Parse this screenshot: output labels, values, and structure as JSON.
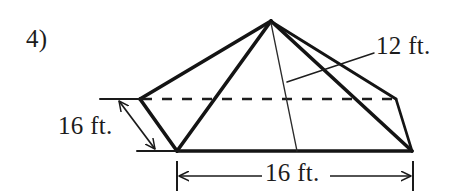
{
  "figure": {
    "problem_number": "4)",
    "shape": "square-pyramid",
    "labels": {
      "slant_height": "12 ft.",
      "left_height": "16 ft.",
      "base_width": "16 ft."
    },
    "colors": {
      "background": "#ffffff",
      "ink": "#1a1a1a",
      "thin_ink": "#2b2b2b"
    },
    "geometry": {
      "apex": [
        271,
        21
      ],
      "rear_left_vertex": [
        140,
        99
      ],
      "rear_right_vertex": [
        396,
        99
      ],
      "front_left_corner": [
        177,
        151
      ],
      "front_right_corner": [
        412,
        151
      ],
      "height_foot": [
        297,
        151
      ],
      "hidden_edge_dash": "10 10"
    },
    "dimensions": {
      "left": {
        "value": "16 ft.",
        "from": [
          118,
          100
        ],
        "to": [
          156,
          150
        ],
        "tick_top_y": 99,
        "tick_bottom_y": 151
      },
      "base": {
        "value": "16 ft.",
        "from": [
          177,
          175
        ],
        "to": [
          413,
          175
        ],
        "tick_left_x": 177,
        "tick_right_x": 413
      },
      "slant": {
        "value": "12 ft.",
        "leader_from": [
          374,
          53
        ],
        "leader_to": [
          287,
          82
        ]
      }
    }
  }
}
